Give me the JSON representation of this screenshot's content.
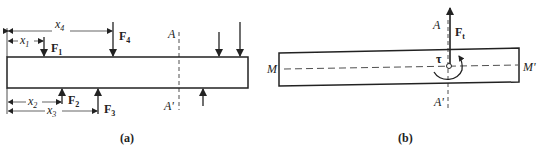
{
  "figure_a": {
    "caption": "(a)",
    "section_top": "A",
    "section_bottom": "A'",
    "forces": [
      {
        "name": "F",
        "sub": "1",
        "direction": "down"
      },
      {
        "name": "F",
        "sub": "2",
        "direction": "up"
      },
      {
        "name": "F",
        "sub": "3",
        "direction": "up"
      },
      {
        "name": "F",
        "sub": "4",
        "direction": "down"
      }
    ],
    "distances": [
      {
        "name": "x",
        "sub": "1"
      },
      {
        "name": "x",
        "sub": "2"
      },
      {
        "name": "x",
        "sub": "3"
      },
      {
        "name": "x",
        "sub": "4"
      }
    ]
  },
  "figure_b": {
    "caption": "(b)",
    "section_top": "A",
    "section_bottom": "A'",
    "axis_left": "M",
    "axis_right": "M'",
    "force": {
      "name": "F",
      "sub": "t"
    },
    "torque": "τ"
  },
  "colors": {
    "line": "#222222",
    "background": "#ffffff"
  }
}
